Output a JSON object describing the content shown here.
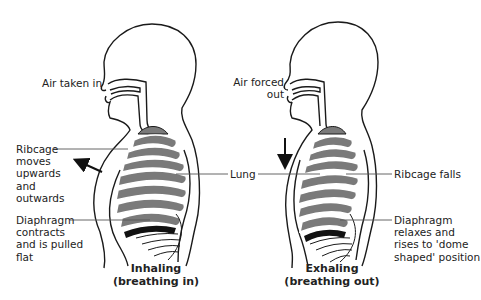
{
  "colors": {
    "outline": "#1a1a1a",
    "lung_fill": "#7a7a7a",
    "diaphragm_fill": "#111111",
    "background": "#ffffff",
    "leader_line": "#555555"
  },
  "inhaling": {
    "air_label": "Air taken in",
    "ribcage_label": [
      "Ribcage",
      "moves",
      "upwards",
      "and",
      "outwards"
    ],
    "diaphragm_label": [
      "Diaphragm",
      "contracts",
      "and is pulled",
      "flat"
    ],
    "caption_line1": "Inhaling",
    "caption_line2": "(breathing in)",
    "arrow_icon": "arrow-up-left-icon"
  },
  "shared": {
    "lung_label": "Lung"
  },
  "exhaling": {
    "air_label_line1": "Air forced",
    "air_label_line2": "out",
    "ribcage_label": "Ribcage falls",
    "diaphragm_label": [
      "Diaphragm",
      "relaxes and",
      "rises to 'dome",
      "shaped' position"
    ],
    "caption_line1": "Exhaling",
    "caption_line2": "(breathing out)",
    "arrow_icon": "arrow-down-icon"
  }
}
